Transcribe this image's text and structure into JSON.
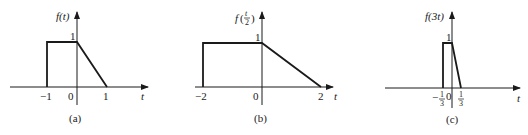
{
  "panels": [
    {
      "id": "a",
      "caption": "(a)",
      "ylabel_func": "f",
      "ylabel_arg": "(t)",
      "xlabel": "t",
      "height_label": "1",
      "ticks": [
        "−1",
        "0",
        "1"
      ],
      "signal": {
        "rect_start": -1,
        "ramp_start": 0,
        "ramp_end": 1,
        "amplitude": 1
      }
    },
    {
      "id": "b",
      "caption": "(b)",
      "ylabel_func": "f",
      "ylabel_arg_num": "t",
      "ylabel_arg_den": "2",
      "xlabel": "t",
      "height_label": "1",
      "ticks": [
        "−2",
        "0",
        "2"
      ],
      "signal": {
        "rect_start": -2,
        "ramp_start": 0,
        "ramp_end": 2,
        "amplitude": 1
      }
    },
    {
      "id": "c",
      "caption": "(c)",
      "ylabel_func": "f",
      "ylabel_arg": "(3t)",
      "xlabel": "t",
      "height_label": "1",
      "ticks": [
        {
          "sign": "−",
          "num": "1",
          "den": "3"
        },
        {
          "text": "0"
        },
        {
          "num": "1",
          "den": "3"
        }
      ],
      "signal": {
        "rect_start": -0.3333,
        "ramp_start": 0,
        "ramp_end": 0.3333,
        "amplitude": 1
      }
    }
  ]
}
